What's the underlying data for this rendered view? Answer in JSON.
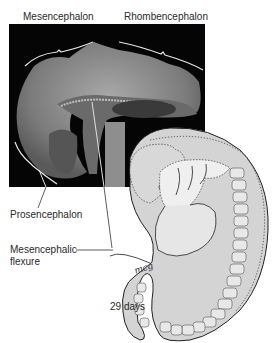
{
  "figure": {
    "labels": {
      "mesencephalon": "Mesencephalon",
      "rhombencephalon": "Rhombencephalon",
      "prosencephalon": "Prosencephalon",
      "mesencephalic_flexure_line1": "Mesencephalic",
      "mesencephalic_flexure_line2": "flexure",
      "age": "29 days",
      "signature": "mcg"
    },
    "colors": {
      "micrograph_bg": "#050505",
      "tissue": "#8a8a8a",
      "embryo_fill": "#d6d6d6",
      "embryo_light": "#ececec",
      "outline": "#222222"
    }
  }
}
